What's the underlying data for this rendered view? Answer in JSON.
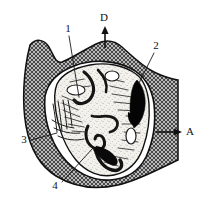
{
  "figure": {
    "background_color": "#ffffff",
    "ink_color": "#111111",
    "hatch_fill_color": "#9a9a9a",
    "solid_black_color": "#000000",
    "interior_fill_color": "#f2f0ec",
    "width": 208,
    "height": 205
  },
  "labels": {
    "n1": "1",
    "n2": "2",
    "n3": "3",
    "n4": "4",
    "letter_a": "A",
    "letter_d": "D"
  },
  "label_positions": {
    "n1": {
      "x": 68,
      "y": 29
    },
    "n2": {
      "x": 156,
      "y": 46
    },
    "n3": {
      "x": 24,
      "y": 140
    },
    "n4": {
      "x": 55,
      "y": 186
    },
    "letter_a": {
      "x": 190,
      "y": 132
    },
    "letter_d": {
      "x": 104,
      "y": 18
    }
  },
  "leaders": {
    "n1": "M 69 36 L 79 97",
    "n2": "M 154 53 L 139 83",
    "n3": "M 31 140 L 57 133",
    "n4": "M 62 182 L 93 148"
  },
  "arrows": {
    "letter_d": {
      "from_x": 105,
      "from_y": 48,
      "to_x": 105,
      "to_y": 30,
      "direction": "up"
    },
    "letter_a": {
      "from_x": 158,
      "from_y": 132,
      "to_x": 182,
      "to_y": 132,
      "direction": "right"
    }
  }
}
